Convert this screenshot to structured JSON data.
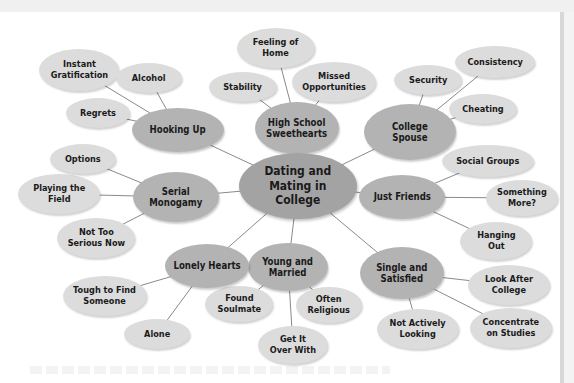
{
  "diagram": {
    "type": "mind-map",
    "colors": {
      "center": "#a3a3a3",
      "hub": "#b3b3b3",
      "satellite": "#dcdcdc",
      "line": "#8a8a8a",
      "text": "#1a1a1a"
    },
    "center": {
      "id": "center",
      "label": "Dating and\nMating in\nCollege",
      "x": 298,
      "y": 186,
      "w": 118,
      "h": 66
    },
    "hubs": [
      {
        "id": "hooking-up",
        "label": "Hooking Up",
        "x": 178,
        "y": 130,
        "w": 92,
        "h": 44
      },
      {
        "id": "high-school-sweethearts",
        "label": "High School\nSweethearts",
        "x": 297,
        "y": 128,
        "w": 84,
        "h": 52
      },
      {
        "id": "college-spouse",
        "label": "College\nSpouse",
        "x": 410,
        "y": 132,
        "w": 92,
        "h": 56
      },
      {
        "id": "just-friends",
        "label": "Just Friends",
        "x": 402,
        "y": 197,
        "w": 86,
        "h": 44
      },
      {
        "id": "single-and-satisfied",
        "label": "Single and\nSatisfied",
        "x": 402,
        "y": 273,
        "w": 84,
        "h": 52
      },
      {
        "id": "young-and-married",
        "label": "Young and\nMarried",
        "x": 288,
        "y": 267,
        "w": 80,
        "h": 48
      },
      {
        "id": "lonely-hearts",
        "label": "Lonely Hearts",
        "x": 207,
        "y": 266,
        "w": 84,
        "h": 44
      },
      {
        "id": "serial-monogamy",
        "label": "Serial\nMonogamy",
        "x": 176,
        "y": 197,
        "w": 86,
        "h": 50
      }
    ],
    "satellites": [
      {
        "parent": "hooking-up",
        "label": "Instant\nGratification",
        "x": 79,
        "y": 70,
        "w": 80,
        "h": 42
      },
      {
        "parent": "hooking-up",
        "label": "Alcohol",
        "x": 149,
        "y": 78,
        "w": 66,
        "h": 30
      },
      {
        "parent": "hooking-up",
        "label": "Regrets",
        "x": 98,
        "y": 113,
        "w": 64,
        "h": 30
      },
      {
        "parent": "high-school-sweethearts",
        "label": "Feeling of\nHome",
        "x": 276,
        "y": 48,
        "w": 78,
        "h": 40
      },
      {
        "parent": "high-school-sweethearts",
        "label": "Stability",
        "x": 243,
        "y": 87,
        "w": 68,
        "h": 30
      },
      {
        "parent": "high-school-sweethearts",
        "label": "Missed\nOpportunities",
        "x": 334,
        "y": 82,
        "w": 84,
        "h": 40
      },
      {
        "parent": "college-spouse",
        "label": "Security",
        "x": 428,
        "y": 80,
        "w": 68,
        "h": 30
      },
      {
        "parent": "college-spouse",
        "label": "Consistency",
        "x": 495,
        "y": 62,
        "w": 80,
        "h": 32
      },
      {
        "parent": "college-spouse",
        "label": "Cheating",
        "x": 483,
        "y": 109,
        "w": 68,
        "h": 30
      },
      {
        "parent": "just-friends",
        "label": "Social Groups",
        "x": 488,
        "y": 161,
        "w": 92,
        "h": 32
      },
      {
        "parent": "just-friends",
        "label": "Something\nMore?",
        "x": 522,
        "y": 198,
        "w": 72,
        "h": 36
      },
      {
        "parent": "just-friends",
        "label": "Hanging\nOut",
        "x": 496,
        "y": 241,
        "w": 72,
        "h": 38
      },
      {
        "parent": "single-and-satisfied",
        "label": "Look After\nCollege",
        "x": 509,
        "y": 285,
        "w": 82,
        "h": 40
      },
      {
        "parent": "single-and-satisfied",
        "label": "Concentrate\non Studies",
        "x": 511,
        "y": 328,
        "w": 82,
        "h": 40
      },
      {
        "parent": "single-and-satisfied",
        "label": "Not Actively\nLooking",
        "x": 418,
        "y": 329,
        "w": 82,
        "h": 40
      },
      {
        "parent": "young-and-married",
        "label": "Often\nReligious",
        "x": 329,
        "y": 305,
        "w": 66,
        "h": 36
      },
      {
        "parent": "young-and-married",
        "label": "Get It\nOver With",
        "x": 293,
        "y": 345,
        "w": 70,
        "h": 38
      },
      {
        "parent": "young-and-married",
        "label": "Found\nSoulmate",
        "x": 239,
        "y": 304,
        "w": 68,
        "h": 36
      },
      {
        "parent": "lonely-hearts",
        "label": "Alone",
        "x": 157,
        "y": 334,
        "w": 66,
        "h": 30
      },
      {
        "parent": "lonely-hearts",
        "label": "Tough to Find\nSomeone",
        "x": 105,
        "y": 296,
        "w": 84,
        "h": 40
      },
      {
        "parent": "serial-monogamy",
        "label": "Not Too\nSerious Now",
        "x": 96,
        "y": 238,
        "w": 78,
        "h": 40
      },
      {
        "parent": "serial-monogamy",
        "label": "Playing the\nField",
        "x": 59,
        "y": 194,
        "w": 82,
        "h": 40
      },
      {
        "parent": "serial-monogamy",
        "label": "Options",
        "x": 83,
        "y": 159,
        "w": 66,
        "h": 30
      }
    ]
  }
}
